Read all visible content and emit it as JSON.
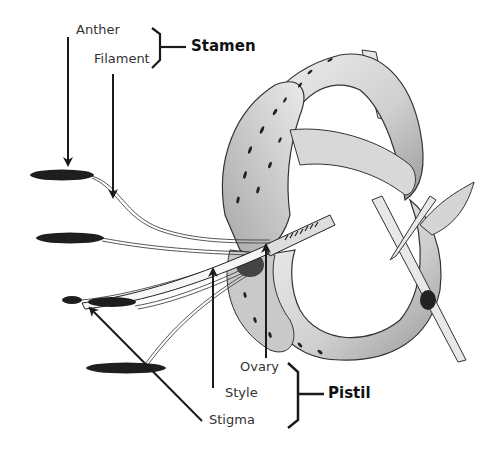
{
  "diagram": {
    "parts": {
      "anther": "Anther",
      "filament": "Filament",
      "ovary": "Ovary",
      "style": "Style",
      "stigma": "Stigma"
    },
    "groups": {
      "stamen": "Stamen",
      "pistil": "Pistil"
    },
    "colors": {
      "ink": "#1a1a1a",
      "label_text": "#333333",
      "petal_shade": "#bdbdbd",
      "background": "#ffffff"
    }
  }
}
